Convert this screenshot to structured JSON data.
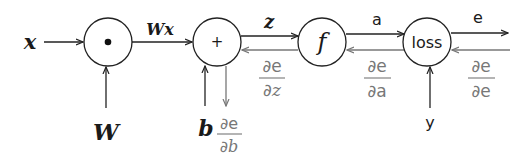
{
  "diagram": {
    "colors": {
      "forward": "#222222",
      "backward": "#777777",
      "background": "#ffffff"
    },
    "inputs": {
      "x": "x",
      "W": "W",
      "b": "b",
      "y": "y"
    },
    "nodes": [
      {
        "id": "mul",
        "label": "•"
      },
      {
        "id": "add",
        "label": "+"
      },
      {
        "id": "act",
        "label": "f"
      },
      {
        "id": "loss",
        "label": "loss"
      }
    ],
    "edges": {
      "wx": "Wx",
      "z": "z",
      "a": "a",
      "e": "e"
    },
    "gradients": {
      "de_dz": {
        "num": "∂e",
        "den_partial": "∂",
        "den_var": "z"
      },
      "de_da": {
        "num": "∂e",
        "den": "∂a"
      },
      "de_de": {
        "num": "∂e",
        "den": "∂e"
      },
      "de_db": {
        "num": "∂e",
        "den_partial": "∂",
        "den_var": "b"
      }
    }
  }
}
